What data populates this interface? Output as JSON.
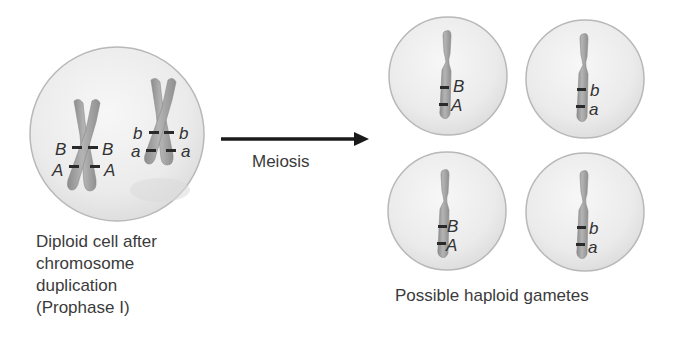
{
  "diagram": {
    "diploid_cell": {
      "caption_lines": [
        "Diploid cell after",
        "chromosome",
        "duplication",
        "(Prophase I)"
      ],
      "chromosomes": [
        {
          "name": "chromosome-AB",
          "left_labels": [
            "B",
            "A"
          ],
          "right_labels": [
            "B",
            "A"
          ]
        },
        {
          "name": "chromosome-ab",
          "left_labels": [
            "b",
            "a"
          ],
          "right_labels": [
            "b",
            "a"
          ]
        }
      ]
    },
    "process": {
      "arrow_label": "Meiosis"
    },
    "gametes": {
      "caption": "Possible haploid gametes",
      "cells": [
        {
          "position": "top-left",
          "labels": [
            "B",
            "A"
          ]
        },
        {
          "position": "top-right",
          "labels": [
            "b",
            "a"
          ]
        },
        {
          "position": "bottom-left",
          "labels": [
            "B",
            "A"
          ]
        },
        {
          "position": "bottom-right",
          "labels": [
            "b",
            "a"
          ]
        }
      ]
    },
    "colors": {
      "cell_fill": "#ececec",
      "cell_stroke": "#b5b5b5",
      "chromosome_fill": "#a3a3a3",
      "band": "#2a2a2a",
      "arrow": "#1a1a1a",
      "text": "#3b3b3b"
    }
  }
}
